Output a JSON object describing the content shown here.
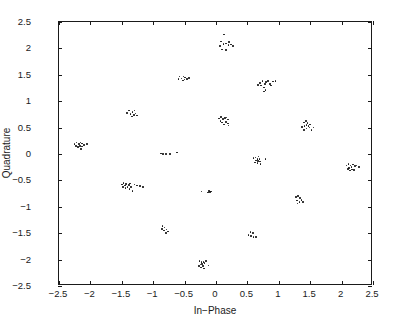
{
  "chart_data": {
    "type": "scatter",
    "title": "",
    "xlabel": "In−Phase",
    "ylabel": "Quadrature",
    "xlim": [
      -2.5,
      2.5
    ],
    "ylim": [
      -2.5,
      2.5
    ],
    "xticks": [
      -2.5,
      -2,
      -1.5,
      -1,
      -0.5,
      0,
      0.5,
      1,
      1.5,
      2,
      2.5
    ],
    "yticks": [
      -2.5,
      -2,
      -1.5,
      -1,
      -0.5,
      0,
      0.5,
      1,
      1.5,
      2,
      2.5
    ],
    "xtick_labels": [
      "−2.5",
      "−2",
      "−1.5",
      "−1",
      "−0.5",
      "0",
      "0.5",
      "1",
      "1.5",
      "2",
      "2.5"
    ],
    "ytick_labels": [
      "−2.5",
      "−2",
      "−1.5",
      "−1",
      "−0.5",
      "0",
      "0.5",
      "1",
      "1.5",
      "2",
      "2.5"
    ],
    "grid": false,
    "legend": null,
    "marker": "dot",
    "marker_color": "#111111",
    "marker_size": 1.6,
    "clusters": [
      {
        "cx": 0.15,
        "cy": 2.1,
        "n": 11,
        "spread": 0.11
      },
      {
        "cx": -0.52,
        "cy": 1.44,
        "n": 9,
        "spread": 0.08
      },
      {
        "cx": 0.78,
        "cy": 1.33,
        "n": 14,
        "spread": 0.12
      },
      {
        "cx": -1.35,
        "cy": 0.78,
        "n": 9,
        "spread": 0.09
      },
      {
        "cx": 0.12,
        "cy": 0.65,
        "n": 12,
        "spread": 0.1
      },
      {
        "cx": 1.45,
        "cy": 0.55,
        "n": 13,
        "spread": 0.11
      },
      {
        "cx": -2.15,
        "cy": 0.18,
        "n": 12,
        "spread": 0.11
      },
      {
        "cx": -0.75,
        "cy": 0.0,
        "n": 5,
        "spread": 0.11
      },
      {
        "cx": 0.66,
        "cy": -0.12,
        "n": 12,
        "spread": 0.1
      },
      {
        "cx": 2.15,
        "cy": -0.25,
        "n": 13,
        "spread": 0.11
      },
      {
        "cx": -1.4,
        "cy": -0.6,
        "n": 16,
        "spread": 0.13
      },
      {
        "cx": -0.15,
        "cy": -0.72,
        "n": 5,
        "spread": 0.09
      },
      {
        "cx": 1.32,
        "cy": -0.86,
        "n": 8,
        "spread": 0.1
      },
      {
        "cx": -0.82,
        "cy": -1.42,
        "n": 7,
        "spread": 0.09
      },
      {
        "cx": 0.57,
        "cy": -1.54,
        "n": 6,
        "spread": 0.09
      },
      {
        "cx": -0.2,
        "cy": -2.1,
        "n": 12,
        "spread": 0.11
      }
    ],
    "points": [
      [
        0.13,
        2.26
      ],
      [
        0.08,
        2.13
      ],
      [
        0.12,
        2.08
      ],
      [
        0.16,
        2.09
      ],
      [
        0.2,
        2.06
      ],
      [
        0.24,
        2.07
      ],
      [
        0.27,
        2.05
      ],
      [
        0.21,
        2.12
      ],
      [
        0.1,
        1.98
      ],
      [
        0.16,
        1.97
      ],
      [
        0.06,
        2.04
      ],
      [
        -0.58,
        1.47
      ],
      [
        -0.55,
        1.43
      ],
      [
        -0.52,
        1.47
      ],
      [
        -0.49,
        1.45
      ],
      [
        -0.53,
        1.39
      ],
      [
        -0.5,
        1.41
      ],
      [
        -0.46,
        1.42
      ],
      [
        -0.43,
        1.44
      ],
      [
        -0.6,
        1.42
      ],
      [
        0.7,
        1.35
      ],
      [
        0.74,
        1.38
      ],
      [
        0.72,
        1.3
      ],
      [
        0.76,
        1.26
      ],
      [
        0.78,
        1.33
      ],
      [
        0.8,
        1.36
      ],
      [
        0.83,
        1.38
      ],
      [
        0.86,
        1.33
      ],
      [
        0.88,
        1.3
      ],
      [
        0.91,
        1.37
      ],
      [
        0.95,
        1.38
      ],
      [
        0.79,
        1.21
      ],
      [
        0.76,
        1.18
      ],
      [
        0.67,
        1.31
      ],
      [
        -1.39,
        0.82
      ],
      [
        -1.42,
        0.78
      ],
      [
        -1.36,
        0.76
      ],
      [
        -1.33,
        0.8
      ],
      [
        -1.3,
        0.82
      ],
      [
        -1.31,
        0.74
      ],
      [
        -1.28,
        0.77
      ],
      [
        -1.34,
        0.71
      ],
      [
        -1.26,
        0.73
      ],
      [
        0.05,
        0.67
      ],
      [
        0.08,
        0.7
      ],
      [
        0.11,
        0.66
      ],
      [
        0.07,
        0.63
      ],
      [
        0.1,
        0.6
      ],
      [
        0.14,
        0.68
      ],
      [
        0.17,
        0.69
      ],
      [
        0.19,
        0.65
      ],
      [
        0.16,
        0.61
      ],
      [
        0.19,
        0.58
      ],
      [
        0.2,
        0.54
      ],
      [
        0.13,
        0.56
      ],
      [
        1.4,
        0.6
      ],
      [
        1.43,
        0.62
      ],
      [
        1.46,
        0.59
      ],
      [
        1.44,
        0.55
      ],
      [
        1.41,
        0.53
      ],
      [
        1.47,
        0.53
      ],
      [
        1.5,
        0.56
      ],
      [
        1.49,
        0.5
      ],
      [
        1.44,
        0.48
      ],
      [
        1.4,
        0.46
      ],
      [
        1.37,
        0.51
      ],
      [
        1.55,
        0.5
      ],
      [
        1.52,
        0.46
      ],
      [
        -2.25,
        0.19
      ],
      [
        -2.22,
        0.22
      ],
      [
        -2.18,
        0.19
      ],
      [
        -2.16,
        0.22
      ],
      [
        -2.13,
        0.2
      ],
      [
        -2.17,
        0.15
      ],
      [
        -2.13,
        0.14
      ],
      [
        -2.1,
        0.17
      ],
      [
        -2.2,
        0.13
      ],
      [
        -2.23,
        0.15
      ],
      [
        -2.05,
        0.19
      ],
      [
        -2.15,
        0.1
      ],
      [
        -0.88,
        0.01
      ],
      [
        -0.84,
        0.0
      ],
      [
        -0.8,
        0.0
      ],
      [
        -0.73,
        0.0
      ],
      [
        -0.62,
        0.03
      ],
      [
        0.6,
        -0.08
      ],
      [
        0.63,
        -0.07
      ],
      [
        0.66,
        -0.09
      ],
      [
        0.64,
        -0.12
      ],
      [
        0.67,
        -0.13
      ],
      [
        0.69,
        -0.1
      ],
      [
        0.7,
        -0.14
      ],
      [
        0.66,
        -0.17
      ],
      [
        0.62,
        -0.16
      ],
      [
        0.71,
        -0.19
      ],
      [
        0.79,
        -0.09
      ],
      [
        0.68,
        -0.05
      ],
      [
        2.08,
        -0.22
      ],
      [
        2.11,
        -0.19
      ],
      [
        2.14,
        -0.22
      ],
      [
        2.12,
        -0.26
      ],
      [
        2.16,
        -0.25
      ],
      [
        2.18,
        -0.2
      ],
      [
        2.21,
        -0.23
      ],
      [
        2.17,
        -0.29
      ],
      [
        2.13,
        -0.31
      ],
      [
        2.2,
        -0.3
      ],
      [
        2.24,
        -0.22
      ],
      [
        2.28,
        -0.25
      ],
      [
        2.1,
        -0.28
      ],
      [
        -1.5,
        -0.58
      ],
      [
        -1.47,
        -0.55
      ],
      [
        -1.45,
        -0.6
      ],
      [
        -1.43,
        -0.57
      ],
      [
        -1.41,
        -0.62
      ],
      [
        -1.44,
        -0.64
      ],
      [
        -1.39,
        -0.59
      ],
      [
        -1.37,
        -0.56
      ],
      [
        -1.35,
        -0.62
      ],
      [
        -1.38,
        -0.66
      ],
      [
        -1.33,
        -0.7
      ],
      [
        -1.3,
        -0.58
      ],
      [
        -1.26,
        -0.6
      ],
      [
        -1.21,
        -0.61
      ],
      [
        -1.16,
        -0.62
      ],
      [
        -1.48,
        -0.63
      ],
      [
        -0.23,
        -0.71
      ],
      [
        -0.13,
        -0.73
      ],
      [
        -0.1,
        -0.72
      ],
      [
        -0.08,
        -0.71
      ],
      [
        -0.11,
        -0.7
      ],
      [
        1.27,
        -0.82
      ],
      [
        1.31,
        -0.8
      ],
      [
        1.34,
        -0.83
      ],
      [
        1.29,
        -0.88
      ],
      [
        1.33,
        -0.91
      ],
      [
        1.36,
        -0.87
      ],
      [
        1.39,
        -0.91
      ],
      [
        1.3,
        -0.94
      ],
      [
        -0.85,
        -1.36
      ],
      [
        -0.82,
        -1.39
      ],
      [
        -0.86,
        -1.42
      ],
      [
        -0.83,
        -1.45
      ],
      [
        -0.79,
        -1.43
      ],
      [
        -0.76,
        -1.47
      ],
      [
        -0.8,
        -1.5
      ],
      [
        0.55,
        -1.48
      ],
      [
        0.59,
        -1.5
      ],
      [
        0.56,
        -1.55
      ],
      [
        0.6,
        -1.57
      ],
      [
        0.64,
        -1.57
      ],
      [
        0.52,
        -1.53
      ],
      [
        -0.26,
        -2.03
      ],
      [
        -0.23,
        -2.05
      ],
      [
        -0.25,
        -2.09
      ],
      [
        -0.22,
        -2.08
      ],
      [
        -0.2,
        -2.05
      ],
      [
        -0.18,
        -2.07
      ],
      [
        -0.21,
        -2.12
      ],
      [
        -0.24,
        -2.15
      ],
      [
        -0.27,
        -2.12
      ],
      [
        -0.16,
        -2.03
      ],
      [
        -0.12,
        -2.11
      ],
      [
        -0.19,
        -2.17
      ]
    ]
  },
  "axes": {
    "x_title": "In−Phase",
    "y_title": "Quadrature"
  }
}
